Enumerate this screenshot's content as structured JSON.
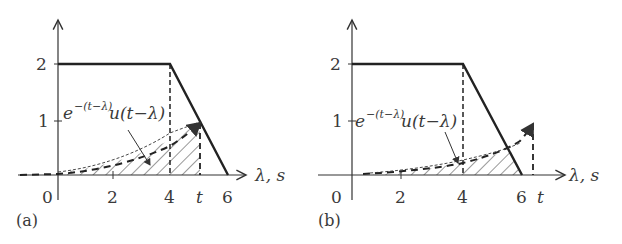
{
  "figure": {
    "panels": [
      {
        "id": "a",
        "panel_label": "(a)",
        "x_axis_label": "λ, s",
        "x_ticks": [
          "0",
          "2",
          "4",
          "t",
          "6"
        ],
        "y_ticks": [
          "1",
          "2"
        ],
        "curve_label_base": "e",
        "curve_label_exp": "−(t−λ)",
        "curve_label_rest": "u(t−λ)",
        "t_value": 5.2
      },
      {
        "id": "b",
        "panel_label": "(b)",
        "x_axis_label": "λ, s",
        "x_ticks": [
          "0",
          "2",
          "4",
          "6",
          "t"
        ],
        "y_ticks": [
          "1",
          "2"
        ],
        "curve_label_base": "e",
        "curve_label_exp": "−(t−λ)",
        "curve_label_rest": "u(t−λ)",
        "t_value": 6.4
      }
    ],
    "signal": {
      "description": "x(λ) = 2 for 0≤λ≤4, linearly decreasing to 0 at λ=6",
      "points": [
        [
          0,
          2
        ],
        [
          4,
          2
        ],
        [
          6,
          0
        ]
      ]
    },
    "colors": {
      "ink": "#2a2a2a",
      "background": "#ffffff"
    }
  }
}
